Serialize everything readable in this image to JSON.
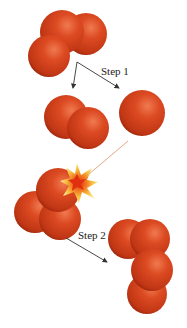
{
  "diagram": {
    "type": "reaction-mechanism",
    "labels": {
      "step1": "Step 1",
      "step2": "Step 2"
    },
    "colors": {
      "atom_base": "#d4401c",
      "atom_highlight": "#f07a50",
      "atom_shadow": "#9a2410",
      "arrow": "#333333",
      "trajectory_line": "#e0906a",
      "burst_outer": "#f8c040",
      "burst_inner": "#e85010"
    },
    "molecules": [
      {
        "name": "ozone-reactant",
        "formula": "O3",
        "atoms": 3
      },
      {
        "name": "oxygen-product-step1",
        "formula": "O2",
        "atoms": 2
      },
      {
        "name": "oxygen-atom",
        "formula": "O",
        "atoms": 1
      },
      {
        "name": "ozone-collision",
        "formula": "O3",
        "atoms": 3
      },
      {
        "name": "oxygen-product-step2-a",
        "formula": "O2",
        "atoms": 2
      },
      {
        "name": "oxygen-product-step2-b",
        "formula": "O2",
        "atoms": 2
      }
    ]
  }
}
